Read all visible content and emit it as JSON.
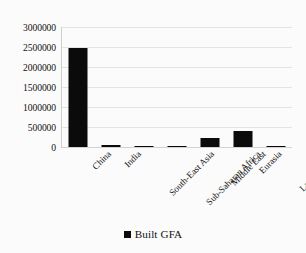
{
  "chart_data": {
    "type": "bar",
    "title": "",
    "xlabel": "",
    "ylabel": "",
    "categories": [
      "China",
      "India",
      "South-East Asia",
      "Sub-Saharan Africa",
      "Middle East",
      "Eurasia",
      "Latin America"
    ],
    "series": [
      {
        "name": "Built GFA",
        "color": "#0b0b0b",
        "values": [
          2475000,
          50000,
          20000,
          35000,
          225000,
          400000,
          25000
        ]
      }
    ],
    "ylim": [
      0,
      3000000
    ],
    "ytick_values": [
      0,
      500000,
      1000000,
      1500000,
      2000000,
      2500000,
      3000000
    ],
    "ytick_labels": [
      "0",
      "500000",
      "1000000",
      "1500000",
      "2000000",
      "2500000",
      "3000000"
    ],
    "grid": true,
    "grid_axis": "y",
    "legend": {
      "position": "bottom",
      "entries": [
        {
          "label": "Built GFA",
          "marker": "square-marker",
          "color": "#0b0b0b"
        }
      ]
    },
    "xtick_rotation": -45,
    "background_color": "#fbfbfb",
    "gridline_color": "#e4e4e4"
  }
}
